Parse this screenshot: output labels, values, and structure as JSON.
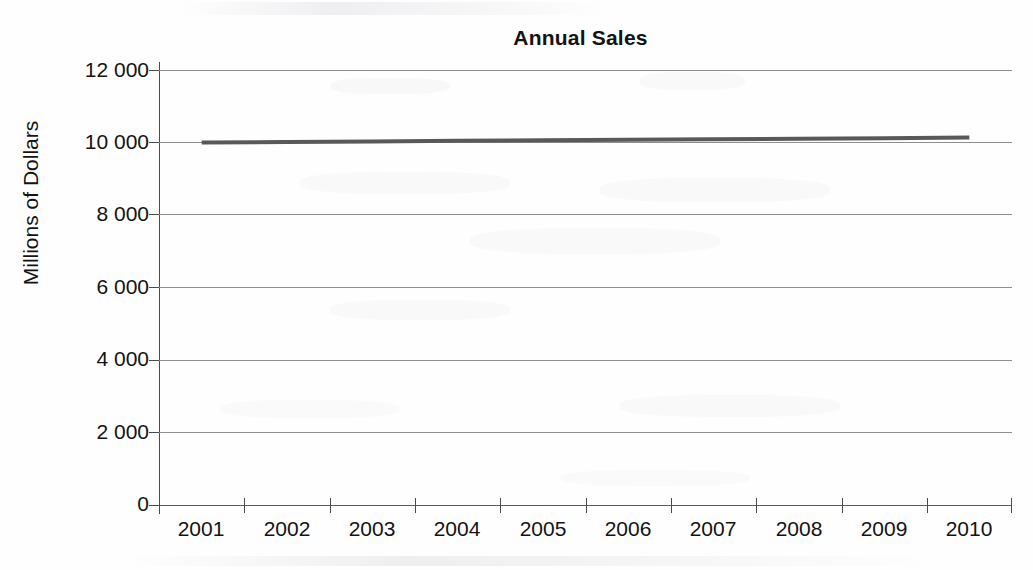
{
  "chart_data": {
    "type": "line",
    "title": "Annual Sales",
    "xlabel": "",
    "ylabel": "Millions of Dollars",
    "categories": [
      "2001",
      "2002",
      "2003",
      "2004",
      "2005",
      "2006",
      "2007",
      "2008",
      "2009",
      "2010"
    ],
    "series": [
      {
        "name": "Annual Sales",
        "values": [
          10000,
          10015,
          10030,
          10045,
          10060,
          10075,
          10090,
          10105,
          10120,
          10135
        ],
        "color": "#595959",
        "line_width": 4
      }
    ],
    "ylim": [
      0,
      12000
    ],
    "ytick_values": [
      0,
      2000,
      4000,
      6000,
      8000,
      10000,
      12000
    ],
    "ytick_labels": [
      "0",
      "2 000",
      "4 000",
      "6 000",
      "8 000",
      "10 000",
      "12 000"
    ],
    "grid": "horizontal",
    "legend": "none",
    "axis_colors": {
      "gridline": "#8e8e90",
      "axis": "#4a4a4c",
      "text": "#131313"
    }
  },
  "figure": {
    "title": "Annual Sales",
    "y_axis_title": "Millions of Dollars",
    "y_ticks": [
      {
        "label": "12 000",
        "value": 12000
      },
      {
        "label": "10 000",
        "value": 10000
      },
      {
        "label": "8 000",
        "value": 8000
      },
      {
        "label": "6 000",
        "value": 6000
      },
      {
        "label": "4 000",
        "value": 4000
      },
      {
        "label": "2 000",
        "value": 2000
      },
      {
        "label": "0",
        "value": 0
      }
    ],
    "x_ticks": [
      {
        "label": "2001"
      },
      {
        "label": "2002"
      },
      {
        "label": "2003"
      },
      {
        "label": "2004"
      },
      {
        "label": "2005"
      },
      {
        "label": "2006"
      },
      {
        "label": "2007"
      },
      {
        "label": "2008"
      },
      {
        "label": "2009"
      },
      {
        "label": "2010"
      }
    ]
  }
}
